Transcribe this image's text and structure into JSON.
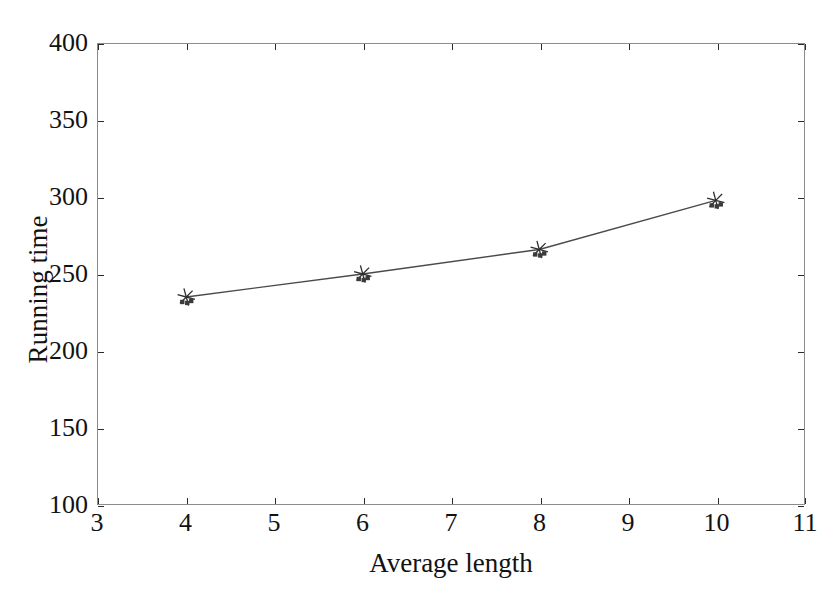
{
  "chart_data": {
    "type": "line",
    "title": "",
    "xlabel": "Average length",
    "ylabel": "Running time",
    "xlim": [
      3,
      11
    ],
    "ylim": [
      100,
      400
    ],
    "xticks": [
      3,
      4,
      5,
      6,
      7,
      8,
      9,
      10,
      11
    ],
    "yticks": [
      100,
      150,
      200,
      250,
      300,
      350,
      400
    ],
    "grid": false,
    "legend": null,
    "marker": "asterisk",
    "line_color": "#4a4a4a",
    "marker_color": "#2e2e2e",
    "x": [
      4,
      6,
      8,
      10
    ],
    "values": [
      235,
      250,
      266,
      298
    ],
    "series": [
      {
        "name": "Running time",
        "x": [
          4,
          6,
          8,
          10
        ],
        "values": [
          235,
          250,
          266,
          298
        ]
      }
    ]
  },
  "axes": {
    "x_tick_labels": [
      "3",
      "4",
      "5",
      "6",
      "7",
      "8",
      "9",
      "10",
      "11"
    ],
    "y_tick_labels": [
      "100",
      "150",
      "200",
      "250",
      "300",
      "350",
      "400"
    ],
    "x_title": "Average length",
    "y_title": "Running time"
  }
}
